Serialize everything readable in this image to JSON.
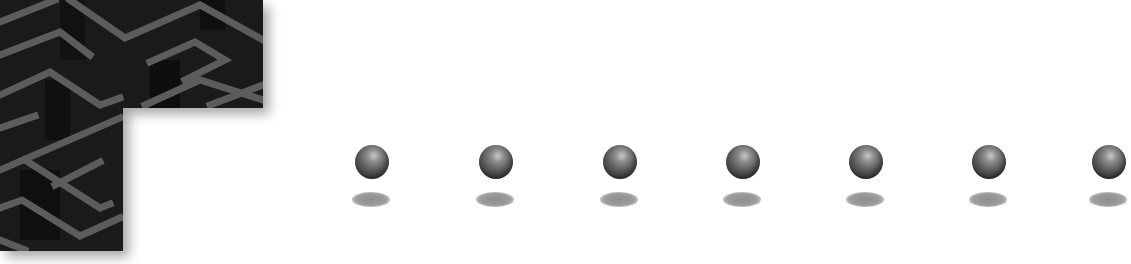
{
  "scene": {
    "background_color": "#ffffff",
    "maze_block": {
      "icon": "maze-pattern-icon",
      "base_color": "#1a1a1a",
      "line_color": "#5c5c5c"
    },
    "balls": [
      {
        "icon": "sphere-icon",
        "left": 352
      },
      {
        "icon": "sphere-icon",
        "left": 476
      },
      {
        "icon": "sphere-icon",
        "left": 600
      },
      {
        "icon": "sphere-icon",
        "left": 723
      },
      {
        "icon": "sphere-icon",
        "left": 846
      },
      {
        "icon": "sphere-icon",
        "left": 969
      },
      {
        "icon": "sphere-icon",
        "left": 1089
      }
    ]
  }
}
